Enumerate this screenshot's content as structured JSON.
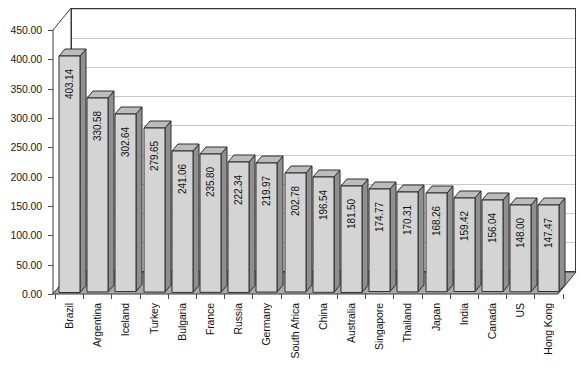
{
  "chart_data": {
    "type": "bar",
    "title": "",
    "subtitle": "",
    "xlabel": "",
    "ylabel": "",
    "ylim": [
      0,
      450
    ],
    "ytick_step": 50,
    "grid": true,
    "legend": false,
    "legend_position": "none",
    "style": "3d-bar",
    "y_tick_labels": [
      "450.00",
      "400.00",
      "350.00",
      "300.00",
      "250.00",
      "200.00",
      "150.00",
      "100.00",
      "50.00",
      "0.00"
    ],
    "y_tick_values": [
      450,
      400,
      350,
      300,
      250,
      200,
      150,
      100,
      50,
      0
    ],
    "categories": [
      "Brazil",
      "Argentina",
      "Iceland",
      "Turkey",
      "Bulgaria",
      "France",
      "Russia",
      "Germany",
      "South Africa",
      "China",
      "Australia",
      "Singapore",
      "Thailand",
      "Japan",
      "India",
      "Canada",
      "US",
      "Hong Kong"
    ],
    "values": [
      403.14,
      330.58,
      302.64,
      279.65,
      241.06,
      235.8,
      222.34,
      219.97,
      202.78,
      196.54,
      181.5,
      174.77,
      170.31,
      168.26,
      159.42,
      156.04,
      148.0,
      147.47
    ],
    "value_labels": [
      "403.14",
      "330.58",
      "302.64",
      "279.65",
      "241.06",
      "235.80",
      "222.34",
      "219.97",
      "202.78",
      "196.54",
      "181.50",
      "174.77",
      "170.31",
      "168.26",
      "159.42",
      "156.04",
      "148.00",
      "147.47"
    ],
    "colors": {
      "bar_front": "#d4d4d4",
      "bar_side": "#8f8f8f",
      "bar_top": "#bcbcbc",
      "bar_outline": "#2e2e2e",
      "gridline": "#c9c9c9",
      "frame": "#3a3a3a",
      "floor": "#a8a8a8",
      "plot_background": "#ffffff",
      "text": "#111111"
    }
  }
}
